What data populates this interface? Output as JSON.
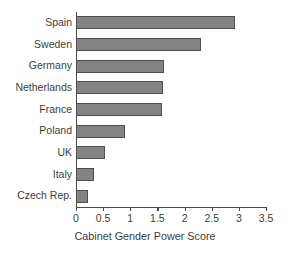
{
  "chart_data": {
    "type": "bar",
    "orientation": "horizontal",
    "title": "",
    "xlabel": "Cabinet Gender Power Score",
    "ylabel": "",
    "categories": [
      "Spain",
      "Sweden",
      "Germany",
      "Netherlands",
      "France",
      "Poland",
      "UK",
      "Italy",
      "Czech Rep."
    ],
    "values": [
      2.93,
      2.3,
      1.62,
      1.6,
      1.58,
      0.9,
      0.53,
      0.33,
      0.22
    ],
    "xlim": [
      0,
      3.5
    ],
    "xticks": [
      0,
      0.5,
      1,
      1.5,
      2,
      2.5,
      3,
      3.5
    ],
    "xtick_labels": [
      "0",
      "0.5",
      "1",
      "1.5",
      "2",
      "2.5",
      "3",
      "3.5"
    ],
    "grid": false,
    "legend": null,
    "bar_color": "#838383",
    "bar_edge_color": "#4e4e4e",
    "axis_color": "#4a4a4a",
    "text_color": "#3d3d3d",
    "background_color": "#ffffff"
  }
}
